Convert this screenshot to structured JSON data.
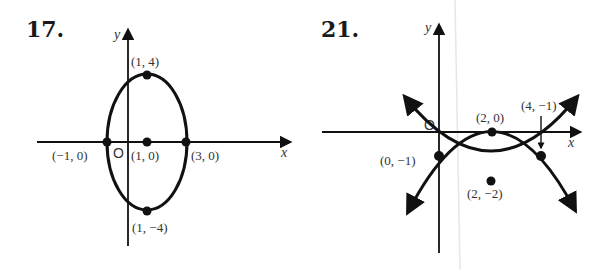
{
  "figures": [
    {
      "number": "17.",
      "description": "Ellipse centered at (1, 0) with vertical major axis",
      "axis_labels": {
        "x": "x",
        "y": "y"
      },
      "origin_label": "O",
      "points": [
        {
          "label": "(1, 4)",
          "x": 1,
          "y": 4
        },
        {
          "label": "(−1, 0)",
          "x": -1,
          "y": 0
        },
        {
          "label": "(1, 0)",
          "x": 1,
          "y": 0
        },
        {
          "label": "(3, 0)",
          "x": 3,
          "y": 0
        },
        {
          "label": "(1, −4)",
          "x": 1,
          "y": -4
        }
      ],
      "curve": {
        "type": "ellipse",
        "center": [
          1,
          0
        ],
        "semi_axis_x": 2,
        "semi_axis_y": 4
      }
    },
    {
      "number": "21.",
      "description": "Two parabolas intersecting at (0, -1) and (4, -1)",
      "axis_labels": {
        "x": "x",
        "y": "y"
      },
      "origin_label": "O",
      "points": [
        {
          "label": "(0, −1)",
          "x": 0,
          "y": -1
        },
        {
          "label": "(2, 0)",
          "x": 2,
          "y": 0
        },
        {
          "label": "(2, −2)",
          "x": 2,
          "y": -2
        },
        {
          "label": "(4, −1)",
          "x": 4,
          "y": -1
        }
      ],
      "curves": [
        {
          "type": "parabola",
          "opens": "down",
          "vertex": [
            2,
            0
          ]
        },
        {
          "type": "parabola",
          "opens": "up",
          "vertex": [
            2,
            -2
          ]
        }
      ],
      "annotation_arrow_target": "(4, −1)"
    }
  ],
  "colors": {
    "ink": "#111111",
    "label": "#333333",
    "background": "#ffffff"
  }
}
